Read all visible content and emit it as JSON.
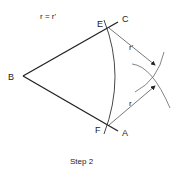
{
  "diagram": {
    "formula": "r = r'",
    "caption": "Step 2",
    "points": {
      "B": "B",
      "C": "C",
      "E": "E",
      "F": "F",
      "A": "A"
    },
    "radius_labels": {
      "upper": "r'",
      "lower": "r"
    },
    "colors": {
      "stroke": "#222222",
      "thin_stroke": "#555555"
    }
  }
}
